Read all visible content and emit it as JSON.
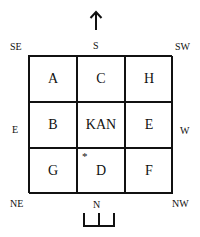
{
  "directions": {
    "top": "S",
    "top_left": "SE",
    "top_right": "SW",
    "left": "E",
    "right": "W",
    "bottom": "N",
    "bottom_left": "NE",
    "bottom_right": "NW"
  },
  "grid": {
    "rows": [
      [
        "A",
        "C",
        "H"
      ],
      [
        "B",
        "KAN",
        "E"
      ],
      [
        "G",
        "D",
        "F"
      ]
    ],
    "marker": "*"
  }
}
